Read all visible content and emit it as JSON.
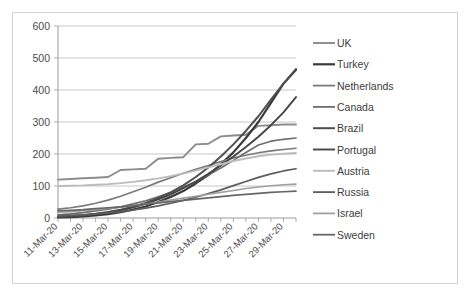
{
  "chart_data": {
    "type": "line",
    "title": "",
    "xlabel": "",
    "ylabel": "",
    "ylim": [
      0,
      600
    ],
    "yticks": [
      0,
      100,
      200,
      300,
      400,
      500,
      600
    ],
    "grid": true,
    "legend_position": "right",
    "x": [
      "11-Mar-20",
      "12-Mar-20",
      "13-Mar-20",
      "14-Mar-20",
      "15-Mar-20",
      "16-Mar-20",
      "17-Mar-20",
      "18-Mar-20",
      "19-Mar-20",
      "20-Mar-20",
      "21-Mar-20",
      "22-Mar-20",
      "23-Mar-20",
      "24-Mar-20",
      "25-Mar-20",
      "26-Mar-20",
      "27-Mar-20",
      "28-Mar-20",
      "29-Mar-20",
      "30-Mar-20"
    ],
    "xtick_labels": [
      "11-Mar-20",
      "13-Mar-20",
      "15-Mar-20",
      "17-Mar-20",
      "19-Mar-20",
      "21-Mar-20",
      "23-Mar-20",
      "25-Mar-20",
      "27-Mar-20",
      "29-Mar-20"
    ],
    "series": [
      {
        "name": "UK",
        "color": "#8c8c8c",
        "width": 1.9,
        "values": [
          120,
          122,
          124,
          126,
          128,
          150,
          152,
          154,
          185,
          188,
          190,
          230,
          232,
          255,
          258,
          260,
          288,
          290,
          292,
          292
        ]
      },
      {
        "name": "Turkey",
        "color": "#3a3a3a",
        "width": 2.2,
        "values": [
          2,
          3,
          5,
          8,
          12,
          18,
          26,
          36,
          50,
          66,
          84,
          108,
          134,
          168,
          205,
          250,
          300,
          360,
          420,
          465
        ]
      },
      {
        "name": "Netherlands",
        "color": "#7a7a7a",
        "width": 1.7,
        "values": [
          28,
          32,
          38,
          46,
          56,
          68,
          82,
          96,
          112,
          126,
          140,
          152,
          164,
          176,
          188,
          196,
          204,
          210,
          214,
          218
        ]
      },
      {
        "name": "Canada",
        "color": "#6e6e6e",
        "width": 1.7,
        "values": [
          10,
          13,
          17,
          22,
          28,
          35,
          44,
          54,
          66,
          80,
          96,
          114,
          134,
          156,
          180,
          205,
          228,
          240,
          246,
          250
        ]
      },
      {
        "name": "Brazil",
        "color": "#4f4f4f",
        "width": 2.0,
        "values": [
          4,
          6,
          9,
          13,
          19,
          26,
          35,
          47,
          62,
          80,
          102,
          128,
          158,
          192,
          230,
          272,
          318,
          370,
          420,
          462
        ]
      },
      {
        "name": "Portugal",
        "color": "#454545",
        "width": 1.9,
        "values": [
          3,
          5,
          8,
          12,
          17,
          24,
          33,
          44,
          58,
          74,
          93,
          114,
          138,
          164,
          192,
          222,
          254,
          290,
          330,
          378
        ]
      },
      {
        "name": "Austria",
        "color": "#bcbcbc",
        "width": 1.9,
        "values": [
          100,
          101,
          102,
          104,
          106,
          109,
          113,
          118,
          124,
          131,
          139,
          148,
          158,
          168,
          178,
          186,
          193,
          198,
          201,
          203
        ]
      },
      {
        "name": "Russia",
        "color": "#5c5c5c",
        "width": 1.7,
        "values": [
          6,
          8,
          10,
          13,
          16,
          20,
          25,
          31,
          38,
          46,
          55,
          65,
          76,
          88,
          101,
          114,
          127,
          138,
          147,
          154
        ]
      },
      {
        "name": "Israel",
        "color": "#a0a0a0",
        "width": 1.6,
        "values": [
          18,
          20,
          23,
          26,
          30,
          34,
          39,
          44,
          50,
          56,
          62,
          68,
          74,
          80,
          86,
          92,
          97,
          101,
          104,
          106
        ]
      },
      {
        "name": "Sweden",
        "color": "#666666",
        "width": 1.7,
        "values": [
          22,
          24,
          26,
          29,
          32,
          35,
          39,
          43,
          47,
          51,
          55,
          59,
          63,
          67,
          71,
          74,
          77,
          80,
          82,
          84
        ]
      }
    ]
  },
  "legend": {
    "items": [
      {
        "label": "UK"
      },
      {
        "label": "Turkey"
      },
      {
        "label": "Netherlands"
      },
      {
        "label": "Canada"
      },
      {
        "label": "Brazil"
      },
      {
        "label": "Portugal"
      },
      {
        "label": "Austria"
      },
      {
        "label": "Russia"
      },
      {
        "label": "Israel"
      },
      {
        "label": "Sweden"
      }
    ]
  }
}
